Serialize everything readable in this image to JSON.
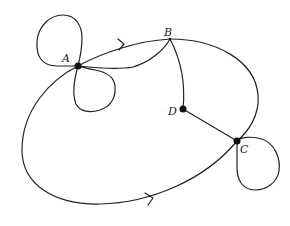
{
  "diagram": {
    "type": "multigraph",
    "vertices": [
      {
        "id": "A",
        "label": "A",
        "x": 78,
        "y": 66
      },
      {
        "id": "B",
        "label": "B",
        "x": 170,
        "y": 39
      },
      {
        "id": "C",
        "label": "C",
        "x": 237,
        "y": 141
      },
      {
        "id": "D",
        "label": "D",
        "x": 183,
        "y": 109
      }
    ],
    "edges": [
      {
        "from": "A",
        "to": "A",
        "kind": "loop",
        "position": "upper-left"
      },
      {
        "from": "A",
        "to": "A",
        "kind": "loop",
        "position": "lower-right"
      },
      {
        "from": "A",
        "to": "B",
        "kind": "curve",
        "directed": true,
        "arrow": "toward B"
      },
      {
        "from": "A",
        "to": "B",
        "kind": "curve",
        "directed": false
      },
      {
        "from": "B",
        "to": "C",
        "kind": "curve",
        "directed": false,
        "via": "right arc"
      },
      {
        "from": "B",
        "to": "D",
        "kind": "curve",
        "directed": false
      },
      {
        "from": "D",
        "to": "C",
        "kind": "line",
        "directed": false
      },
      {
        "from": "A",
        "to": "C",
        "kind": "curve",
        "directed": true,
        "via": "bottom arc",
        "arrow": "toward C"
      },
      {
        "from": "C",
        "to": "C",
        "kind": "loop",
        "position": "lower-right"
      }
    ],
    "colors": {
      "stroke": "#222222",
      "vertex": "#111111",
      "background": "#ffffff"
    }
  }
}
